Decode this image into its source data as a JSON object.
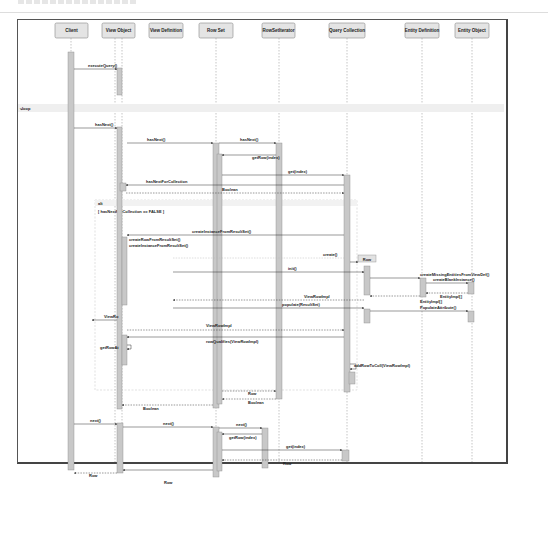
{
  "diagram": {
    "type": "uml-sequence",
    "lifelines": [
      {
        "id": "client",
        "label": "Client",
        "x": 70
      },
      {
        "id": "view-object",
        "label": "View Object",
        "x": 120
      },
      {
        "id": "view-definition",
        "label": "View Definition",
        "x": 168
      },
      {
        "id": "row-set",
        "label": "Row Set",
        "x": 216
      },
      {
        "id": "rowset-iterator",
        "label": "RowSetIterator",
        "x": 278
      },
      {
        "id": "query-collection",
        "label": "Query Collection",
        "x": 347
      },
      {
        "id": "entity-definition",
        "label": "Entity Definition",
        "x": 422
      },
      {
        "id": "entity-object",
        "label": "Entity Object",
        "x": 472
      }
    ],
    "fragments": {
      "loop": {
        "operator": "loop"
      },
      "alt": {
        "operator": "alt",
        "guard": "[ hasNextForCollection == FALSE ]"
      }
    },
    "messages": [
      {
        "label": "executeQuery()",
        "from": "client",
        "to": "view-object",
        "kind": "sync"
      },
      {
        "label": "hasNext()",
        "from": "client",
        "to": "view-object",
        "kind": "sync"
      },
      {
        "label": "hasNext()",
        "from": "view-object",
        "to": "row-set",
        "kind": "sync"
      },
      {
        "label": "hasNext()",
        "from": "row-set",
        "to": "rowset-iterator",
        "kind": "sync"
      },
      {
        "label": "getRow(index)",
        "from": "rowset-iterator",
        "to": "row-set",
        "kind": "sync"
      },
      {
        "label": "get(index)",
        "from": "row-set",
        "to": "query-collection",
        "kind": "sync"
      },
      {
        "label": "hasNextForCollection",
        "from": "query-collection",
        "to": "view-object",
        "kind": "sync"
      },
      {
        "label": "Boolean",
        "from": "view-object",
        "to": "query-collection",
        "kind": "return"
      },
      {
        "label": "createInstanceFromResultSet()",
        "from": "query-collection",
        "to": "view-object",
        "kind": "sync"
      },
      {
        "label": "createRowFromResultSet()",
        "from": "view-object",
        "to": "view-object",
        "kind": "self"
      },
      {
        "label": "createInstanceFromResultSet()",
        "from": "view-object",
        "to": "view-object",
        "kind": "self"
      },
      {
        "label": "create()",
        "from": "view-definition",
        "to": "query-collection",
        "kind": "create"
      },
      {
        "label": "Row",
        "from": "query-collection",
        "to": "query-collection",
        "kind": "object"
      },
      {
        "label": "init()",
        "from": "view-definition",
        "to": "query-collection",
        "kind": "sync"
      },
      {
        "label": "createMissingEntitiesFromViewDef()",
        "from": "query-collection",
        "to": "entity-definition",
        "kind": "sync"
      },
      {
        "label": "createBlankInstance()",
        "from": "entity-definition",
        "to": "entity-object",
        "kind": "sync"
      },
      {
        "label": "EntityImpl[]",
        "from": "entity-object",
        "to": "entity-definition",
        "kind": "return"
      },
      {
        "label": "EntityImpl[]",
        "from": "entity-definition",
        "to": "query-collection",
        "kind": "return"
      },
      {
        "label": "ViewRowImpl",
        "from": "query-collection",
        "to": "view-definition",
        "kind": "return"
      },
      {
        "label": "populate(ResultSet)",
        "from": "view-definition",
        "to": "query-collection",
        "kind": "sync"
      },
      {
        "label": "PopulateAttribute()",
        "from": "query-collection",
        "to": "entity-object",
        "kind": "sync"
      },
      {
        "label": "ViewRo",
        "from": "view-object",
        "to": "client",
        "kind": "return"
      },
      {
        "label": "ViewRowImpl",
        "from": "view-object",
        "to": "query-collection",
        "kind": "return"
      },
      {
        "label": "rowQualifies(ViewRowImpl)",
        "from": "query-collection",
        "to": "view-object",
        "kind": "sync"
      },
      {
        "label": "getRowAt",
        "from": "view-object",
        "to": "view-object",
        "kind": "self"
      },
      {
        "label": "addRowToColl(ViewRowImpl)",
        "from": "query-collection",
        "to": "query-collection",
        "kind": "self"
      },
      {
        "label": "Row",
        "from": "row-set",
        "to": "rowset-iterator",
        "kind": "return"
      },
      {
        "label": "Boolean",
        "from": "rowset-iterator",
        "to": "row-set",
        "kind": "return"
      },
      {
        "label": "Boolean",
        "from": "row-set",
        "to": "view-object",
        "kind": "return"
      },
      {
        "label": "next()",
        "from": "client",
        "to": "view-object",
        "kind": "sync"
      },
      {
        "label": "next()",
        "from": "view-object",
        "to": "row-set",
        "kind": "sync"
      },
      {
        "label": "next()",
        "from": "row-set",
        "to": "rowset-iterator",
        "kind": "sync"
      },
      {
        "label": "getRow(index)",
        "from": "rowset-iterator",
        "to": "row-set",
        "kind": "sync"
      },
      {
        "label": "get(index)",
        "from": "row-set",
        "to": "query-collection",
        "kind": "sync"
      },
      {
        "label": "Row",
        "from": "query-collection",
        "to": "row-set",
        "kind": "return"
      },
      {
        "label": "Row",
        "from": "row-set",
        "to": "view-object",
        "kind": "return"
      },
      {
        "label": "Row",
        "from": "view-object",
        "to": "client",
        "kind": "return"
      }
    ]
  }
}
